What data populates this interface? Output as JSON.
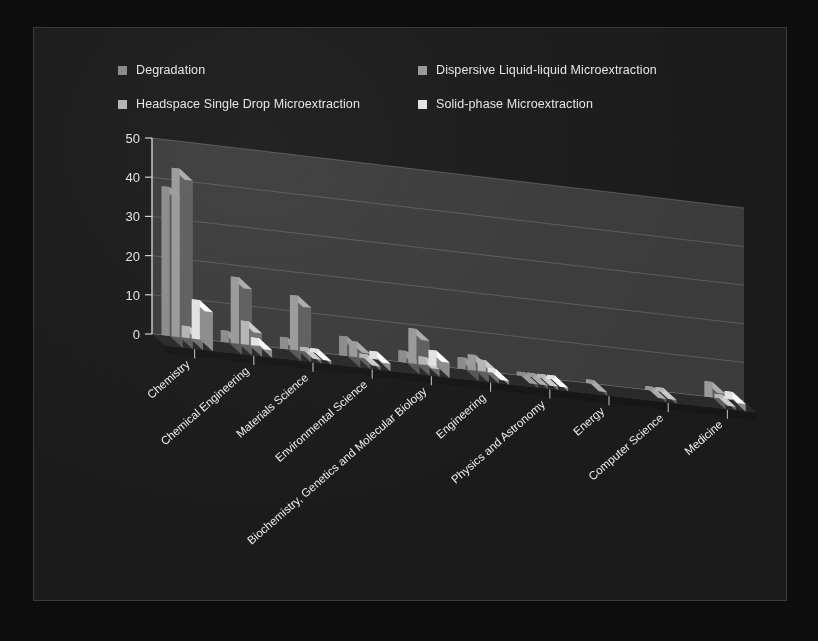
{
  "legend": {
    "items": [
      {
        "label": "Degradation",
        "color": "#8c8c8c"
      },
      {
        "label": "Dispersive Liquid-liquid Microextraction",
        "color": "#9a9a9a"
      },
      {
        "label": "Headspace Single Drop Microextraction",
        "color": "#b5b5b5"
      },
      {
        "label": "Solid-phase Microextraction",
        "color": "#e2e2e2"
      }
    ]
  },
  "axis": {
    "y_ticks": [
      "0",
      "10",
      "20",
      "30",
      "40",
      "50"
    ],
    "y_min": 0,
    "y_max": 50
  },
  "chart_data": {
    "type": "bar",
    "title": "",
    "xlabel": "",
    "ylabel": "",
    "ylim": [
      0,
      50
    ],
    "grid": true,
    "legend_position": "top",
    "projection": "3d",
    "categories": [
      "Chemistry",
      "Chemical Engineering",
      "Materials Science",
      "Environmental Science",
      "Biochemistry, Genetics and Molecular Biology",
      "Engineering",
      "Physics and Astronomy",
      "Energy",
      "Computer Science",
      "Medicine"
    ],
    "series": [
      {
        "name": "Degradation",
        "color": "#8c8c8c",
        "values": [
          38,
          3,
          3,
          5,
          3,
          3,
          1,
          0,
          0,
          0
        ]
      },
      {
        "name": "Dispersive Liquid-liquid Microextraction",
        "color": "#9a9a9a",
        "values": [
          43,
          17,
          14,
          4,
          9,
          4,
          1,
          1,
          1,
          4
        ]
      },
      {
        "name": "Headspace Single Drop Microextraction",
        "color": "#b5b5b5",
        "values": [
          3,
          6,
          1,
          1,
          2,
          3,
          1,
          0,
          1,
          1
        ]
      },
      {
        "name": "Solid-phase Microextraction",
        "color": "#e2e2e2",
        "values": [
          10,
          2,
          1,
          2,
          4,
          1,
          1,
          0,
          0,
          2
        ]
      }
    ]
  }
}
